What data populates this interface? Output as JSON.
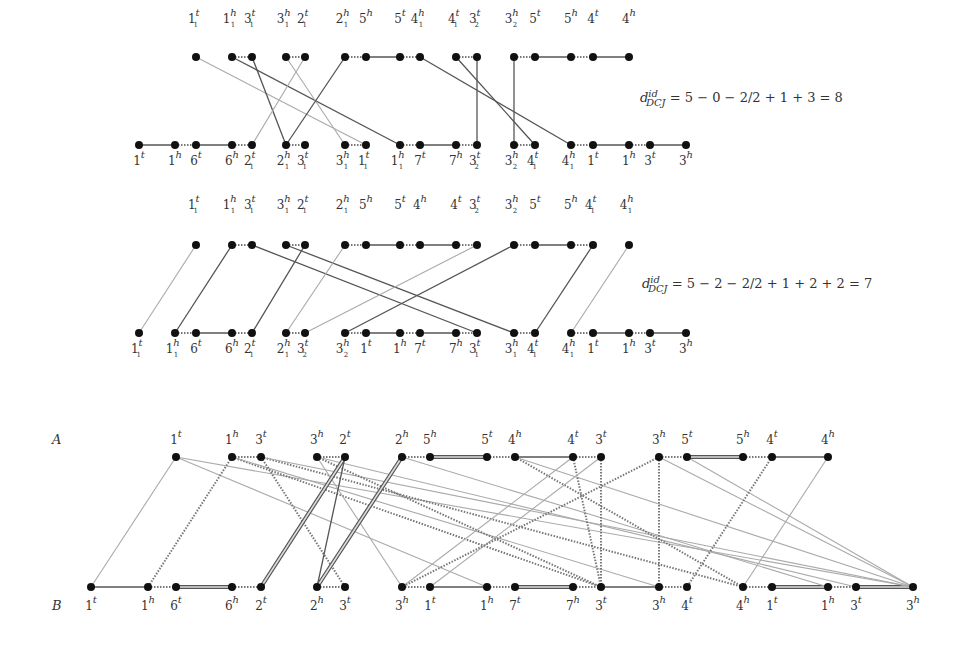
{
  "colors": {
    "node": "#111111",
    "edge_dark": "#555555",
    "edge_mid": "#7a7a7a",
    "edge_light": "#aaaaaa",
    "text": "#333333"
  },
  "panels": [
    {
      "id": "panel1",
      "formula": {
        "d": "d",
        "sup": "id",
        "sub": "DCJ",
        "expr": "= 5 − 0 − 2/2 + 1 + 3 = 8",
        "x": 640,
        "y": 97
      },
      "top_y": 57,
      "bottom_y": 145,
      "label_top_y": 10,
      "label_bottom_y": 152,
      "top": [
        {
          "x": 196,
          "g": "1",
          "s": "1",
          "e": "t"
        },
        {
          "x": 232,
          "g": "1",
          "s": "1",
          "e": "h"
        },
        {
          "x": 252,
          "g": "3",
          "s": "1",
          "e": "t"
        },
        {
          "x": 286,
          "g": "3",
          "s": "1",
          "e": "h"
        },
        {
          "x": 305,
          "g": "2",
          "s": "1",
          "e": "t"
        },
        {
          "x": 345,
          "g": "2",
          "s": "1",
          "e": "h"
        },
        {
          "x": 366,
          "g": "5",
          "s": "",
          "e": "h"
        },
        {
          "x": 400,
          "g": "5",
          "s": "",
          "e": "t"
        },
        {
          "x": 420,
          "g": "4",
          "s": "1",
          "e": "h"
        },
        {
          "x": 456,
          "g": "4",
          "s": "1",
          "e": "t"
        },
        {
          "x": 477,
          "g": "3",
          "s": "2",
          "e": "t"
        },
        {
          "x": 514,
          "g": "3",
          "s": "2",
          "e": "h"
        },
        {
          "x": 535,
          "g": "5",
          "s": "",
          "e": "t"
        },
        {
          "x": 571,
          "g": "5",
          "s": "",
          "e": "h"
        },
        {
          "x": 593,
          "g": "4",
          "s": "",
          "e": "t"
        },
        {
          "x": 629,
          "g": "4",
          "s": "",
          "e": "h"
        }
      ],
      "bottom": [
        {
          "x": 139,
          "g": "1",
          "s": "",
          "e": "t"
        },
        {
          "x": 175,
          "g": "1",
          "s": "",
          "e": "h"
        },
        {
          "x": 196,
          "g": "6",
          "s": "",
          "e": "t"
        },
        {
          "x": 232,
          "g": "6",
          "s": "",
          "e": "h"
        },
        {
          "x": 252,
          "g": "2",
          "s": "1",
          "e": "t"
        },
        {
          "x": 286,
          "g": "2",
          "s": "1",
          "e": "h"
        },
        {
          "x": 305,
          "g": "3",
          "s": "1",
          "e": "t"
        },
        {
          "x": 345,
          "g": "3",
          "s": "1",
          "e": "h"
        },
        {
          "x": 366,
          "g": "1",
          "s": "1",
          "e": "t"
        },
        {
          "x": 400,
          "g": "1",
          "s": "1",
          "e": "h"
        },
        {
          "x": 420,
          "g": "7",
          "s": "",
          "e": "t"
        },
        {
          "x": 456,
          "g": "7",
          "s": "",
          "e": "h"
        },
        {
          "x": 477,
          "g": "3",
          "s": "2",
          "e": "t"
        },
        {
          "x": 514,
          "g": "3",
          "s": "2",
          "e": "h"
        },
        {
          "x": 535,
          "g": "4",
          "s": "1",
          "e": "t"
        },
        {
          "x": 571,
          "g": "4",
          "s": "1",
          "e": "h"
        },
        {
          "x": 593,
          "g": "1",
          "s": "",
          "e": "t"
        },
        {
          "x": 629,
          "g": "1",
          "s": "",
          "e": "h"
        },
        {
          "x": 650,
          "g": "3",
          "s": "",
          "e": "t"
        },
        {
          "x": 686,
          "g": "3",
          "s": "",
          "e": "h"
        }
      ],
      "top_adj": [
        [
          1,
          2,
          "d"
        ],
        [
          3,
          4,
          "d"
        ],
        [
          5,
          6,
          "d"
        ],
        [
          6,
          7,
          "s"
        ],
        [
          7,
          8,
          "d"
        ],
        [
          9,
          10,
          "d"
        ],
        [
          11,
          12,
          "d"
        ],
        [
          12,
          13,
          "s"
        ],
        [
          13,
          14,
          "d"
        ],
        [
          14,
          15,
          "s"
        ]
      ],
      "bottom_adj": [
        [
          0,
          1,
          "s"
        ],
        [
          1,
          2,
          "d"
        ],
        [
          2,
          3,
          "s"
        ],
        [
          3,
          4,
          "d"
        ],
        [
          5,
          6,
          "d"
        ],
        [
          7,
          8,
          "d"
        ],
        [
          9,
          10,
          "d"
        ],
        [
          10,
          11,
          "s"
        ],
        [
          11,
          12,
          "d"
        ],
        [
          13,
          14,
          "d"
        ],
        [
          15,
          16,
          "d"
        ],
        [
          16,
          17,
          "s"
        ],
        [
          17,
          18,
          "d"
        ],
        [
          18,
          19,
          "s"
        ]
      ],
      "cross": [
        [
          0,
          8,
          "l"
        ],
        [
          1,
          9,
          "m"
        ],
        [
          2,
          5,
          "m"
        ],
        [
          3,
          7,
          "l"
        ],
        [
          4,
          4,
          "l"
        ],
        [
          5,
          5,
          "m"
        ],
        [
          8,
          15,
          "m"
        ],
        [
          9,
          14,
          "m"
        ],
        [
          10,
          12,
          "m"
        ],
        [
          11,
          13,
          "m"
        ]
      ]
    },
    {
      "id": "panel2",
      "formula": {
        "d": "d",
        "sup": "id",
        "sub": "DCJ",
        "expr": "= 5 − 2 − 2/2 + 1 + 2 + 2 = 7",
        "x": 642,
        "y": 282
      },
      "top_y": 245,
      "bottom_y": 333,
      "label_top_y": 196,
      "label_bottom_y": 340,
      "top": [
        {
          "x": 196,
          "g": "1",
          "s": "1",
          "e": "t"
        },
        {
          "x": 232,
          "g": "1",
          "s": "1",
          "e": "h"
        },
        {
          "x": 252,
          "g": "3",
          "s": "1",
          "e": "t"
        },
        {
          "x": 286,
          "g": "3",
          "s": "1",
          "e": "h"
        },
        {
          "x": 305,
          "g": "2",
          "s": "1",
          "e": "t"
        },
        {
          "x": 345,
          "g": "2",
          "s": "1",
          "e": "h"
        },
        {
          "x": 366,
          "g": "5",
          "s": "",
          "e": "h"
        },
        {
          "x": 400,
          "g": "5",
          "s": "",
          "e": "t"
        },
        {
          "x": 420,
          "g": "4",
          "s": "",
          "e": "h"
        },
        {
          "x": 456,
          "g": "4",
          "s": "",
          "e": "t"
        },
        {
          "x": 477,
          "g": "3",
          "s": "2",
          "e": "t"
        },
        {
          "x": 514,
          "g": "3",
          "s": "2",
          "e": "h"
        },
        {
          "x": 535,
          "g": "5",
          "s": "",
          "e": "t"
        },
        {
          "x": 571,
          "g": "5",
          "s": "",
          "e": "h"
        },
        {
          "x": 593,
          "g": "4",
          "s": "1",
          "e": "t"
        },
        {
          "x": 629,
          "g": "4",
          "s": "1",
          "e": "h"
        }
      ],
      "bottom": [
        {
          "x": 139,
          "g": "1",
          "s": "1",
          "e": "t"
        },
        {
          "x": 175,
          "g": "1",
          "s": "1",
          "e": "h"
        },
        {
          "x": 196,
          "g": "6",
          "s": "",
          "e": "t"
        },
        {
          "x": 232,
          "g": "6",
          "s": "",
          "e": "h"
        },
        {
          "x": 252,
          "g": "2",
          "s": "1",
          "e": "t"
        },
        {
          "x": 286,
          "g": "2",
          "s": "1",
          "e": "h"
        },
        {
          "x": 305,
          "g": "3",
          "s": "2",
          "e": "t"
        },
        {
          "x": 345,
          "g": "3",
          "s": "2",
          "e": "h"
        },
        {
          "x": 366,
          "g": "1",
          "s": "",
          "e": "t"
        },
        {
          "x": 400,
          "g": "1",
          "s": "",
          "e": "h"
        },
        {
          "x": 420,
          "g": "7",
          "s": "",
          "e": "t"
        },
        {
          "x": 456,
          "g": "7",
          "s": "",
          "e": "h"
        },
        {
          "x": 477,
          "g": "3",
          "s": "1",
          "e": "t"
        },
        {
          "x": 514,
          "g": "3",
          "s": "1",
          "e": "h"
        },
        {
          "x": 535,
          "g": "4",
          "s": "1",
          "e": "t"
        },
        {
          "x": 571,
          "g": "4",
          "s": "1",
          "e": "h"
        },
        {
          "x": 593,
          "g": "1",
          "s": "",
          "e": "t"
        },
        {
          "x": 629,
          "g": "1",
          "s": "",
          "e": "h"
        },
        {
          "x": 650,
          "g": "3",
          "s": "",
          "e": "t"
        },
        {
          "x": 686,
          "g": "3",
          "s": "",
          "e": "h"
        }
      ],
      "top_adj": [
        [
          1,
          2,
          "d"
        ],
        [
          3,
          4,
          "d"
        ],
        [
          5,
          6,
          "d"
        ],
        [
          6,
          7,
          "s"
        ],
        [
          7,
          8,
          "d"
        ],
        [
          8,
          9,
          "s"
        ],
        [
          9,
          10,
          "d"
        ],
        [
          11,
          12,
          "d"
        ],
        [
          12,
          13,
          "s"
        ],
        [
          13,
          14,
          "d"
        ]
      ],
      "bottom_adj": [
        [
          1,
          2,
          "d"
        ],
        [
          2,
          3,
          "s"
        ],
        [
          3,
          4,
          "d"
        ],
        [
          5,
          6,
          "d"
        ],
        [
          7,
          8,
          "d"
        ],
        [
          8,
          9,
          "s"
        ],
        [
          9,
          10,
          "d"
        ],
        [
          10,
          11,
          "s"
        ],
        [
          11,
          12,
          "d"
        ],
        [
          13,
          14,
          "d"
        ],
        [
          15,
          16,
          "d"
        ],
        [
          16,
          17,
          "s"
        ],
        [
          17,
          18,
          "d"
        ],
        [
          18,
          19,
          "s"
        ]
      ],
      "cross": [
        [
          0,
          0,
          "l"
        ],
        [
          1,
          1,
          "m"
        ],
        [
          2,
          12,
          "m"
        ],
        [
          3,
          13,
          "m"
        ],
        [
          4,
          4,
          "m"
        ],
        [
          5,
          5,
          "l"
        ],
        [
          10,
          6,
          "l"
        ],
        [
          11,
          7,
          "m"
        ],
        [
          14,
          14,
          "m"
        ],
        [
          15,
          15,
          "l"
        ]
      ]
    }
  ],
  "panel3": {
    "label_a": "A",
    "label_b": "B",
    "top_y": 457,
    "bottom_y": 587,
    "label_top_y": 431,
    "label_bottom_y": 597,
    "top": [
      {
        "x": 176,
        "g": "1",
        "e": "t"
      },
      {
        "x": 232,
        "g": "1",
        "e": "h"
      },
      {
        "x": 261,
        "g": "3",
        "e": "t"
      },
      {
        "x": 317,
        "g": "3",
        "e": "h"
      },
      {
        "x": 345,
        "g": "2",
        "e": "t"
      },
      {
        "x": 402,
        "g": "2",
        "e": "h"
      },
      {
        "x": 430,
        "g": "5",
        "e": "h"
      },
      {
        "x": 487,
        "g": "5",
        "e": "t"
      },
      {
        "x": 515,
        "g": "4",
        "e": "h"
      },
      {
        "x": 573,
        "g": "4",
        "e": "t"
      },
      {
        "x": 601,
        "g": "3",
        "e": "t"
      },
      {
        "x": 659,
        "g": "3",
        "e": "h"
      },
      {
        "x": 687,
        "g": "5",
        "e": "t"
      },
      {
        "x": 743,
        "g": "5",
        "e": "h"
      },
      {
        "x": 772,
        "g": "4",
        "e": "t"
      },
      {
        "x": 828,
        "g": "4",
        "e": "h"
      }
    ],
    "bottom": [
      {
        "x": 91,
        "g": "1",
        "e": "t"
      },
      {
        "x": 148,
        "g": "1",
        "e": "h"
      },
      {
        "x": 176,
        "g": "6",
        "e": "t"
      },
      {
        "x": 232,
        "g": "6",
        "e": "h"
      },
      {
        "x": 261,
        "g": "2",
        "e": "t"
      },
      {
        "x": 317,
        "g": "2",
        "e": "h"
      },
      {
        "x": 345,
        "g": "3",
        "e": "t"
      },
      {
        "x": 402,
        "g": "3",
        "e": "h"
      },
      {
        "x": 430,
        "g": "1",
        "e": "t"
      },
      {
        "x": 487,
        "g": "1",
        "e": "h"
      },
      {
        "x": 515,
        "g": "7",
        "e": "t"
      },
      {
        "x": 573,
        "g": "7",
        "e": "h"
      },
      {
        "x": 601,
        "g": "3",
        "e": "t"
      },
      {
        "x": 659,
        "g": "3",
        "e": "h"
      },
      {
        "x": 687,
        "g": "4",
        "e": "t"
      },
      {
        "x": 743,
        "g": "4",
        "e": "h"
      },
      {
        "x": 772,
        "g": "1",
        "e": "t"
      },
      {
        "x": 828,
        "g": "1",
        "e": "h"
      },
      {
        "x": 856,
        "g": "3",
        "e": "t"
      },
      {
        "x": 913,
        "g": "3",
        "e": "h"
      }
    ],
    "top_adj": [
      [
        1,
        2,
        "d"
      ],
      [
        3,
        4,
        "d"
      ],
      [
        5,
        6,
        "d"
      ],
      [
        6,
        7,
        "w"
      ],
      [
        7,
        8,
        "d"
      ],
      [
        8,
        9,
        "s"
      ],
      [
        9,
        10,
        "d"
      ],
      [
        11,
        12,
        "d"
      ],
      [
        12,
        13,
        "w"
      ],
      [
        13,
        14,
        "d"
      ],
      [
        14,
        15,
        "s"
      ]
    ],
    "bottom_adj": [
      [
        0,
        1,
        "s"
      ],
      [
        1,
        2,
        "d"
      ],
      [
        2,
        3,
        "w"
      ],
      [
        3,
        4,
        "d"
      ],
      [
        5,
        6,
        "d"
      ],
      [
        7,
        8,
        "d"
      ],
      [
        8,
        9,
        "s"
      ],
      [
        9,
        10,
        "d"
      ],
      [
        10,
        11,
        "w"
      ],
      [
        11,
        12,
        "d"
      ],
      [
        12,
        13,
        "s"
      ],
      [
        13,
        14,
        "d"
      ],
      [
        15,
        16,
        "d"
      ],
      [
        16,
        17,
        "w"
      ],
      [
        17,
        18,
        "d"
      ],
      [
        18,
        19,
        "w"
      ]
    ],
    "cross": [
      [
        0,
        0,
        "l"
      ],
      [
        0,
        9,
        "l"
      ],
      [
        0,
        19,
        "l"
      ],
      [
        1,
        1,
        "d"
      ],
      [
        1,
        12,
        "d"
      ],
      [
        1,
        13,
        "l"
      ],
      [
        2,
        6,
        "d"
      ],
      [
        2,
        15,
        "d"
      ],
      [
        2,
        19,
        "l"
      ],
      [
        3,
        7,
        "l"
      ],
      [
        3,
        12,
        "d"
      ],
      [
        3,
        18,
        "l"
      ],
      [
        4,
        4,
        "w"
      ],
      [
        4,
        5,
        "m"
      ],
      [
        5,
        5,
        "w"
      ],
      [
        5,
        17,
        "l"
      ],
      [
        8,
        15,
        "d"
      ],
      [
        8,
        19,
        "l"
      ],
      [
        9,
        12,
        "d"
      ],
      [
        9,
        7,
        "l"
      ],
      [
        10,
        8,
        "l"
      ],
      [
        10,
        12,
        "d"
      ],
      [
        11,
        7,
        "d"
      ],
      [
        11,
        13,
        "d"
      ],
      [
        11,
        19,
        "l"
      ],
      [
        12,
        19,
        "l"
      ],
      [
        14,
        14,
        "d"
      ],
      [
        15,
        15,
        "l"
      ]
    ]
  }
}
